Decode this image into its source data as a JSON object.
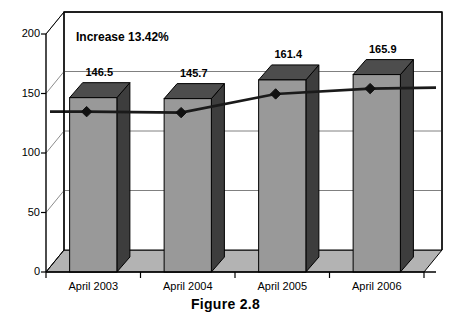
{
  "caption": "Figure 2.8",
  "annotation": "Increase 13.42%",
  "chart_data": {
    "type": "bar",
    "title": "",
    "subtitle": "",
    "xlabel": "",
    "ylabel": "",
    "categories": [
      "April 2003",
      "April 2004",
      "April 2005",
      "April 2006"
    ],
    "values": [
      146.5,
      145.7,
      161.4,
      165.9
    ],
    "data_labels": [
      "146.5",
      "145.7",
      "161.4",
      "165.9"
    ],
    "series": [
      {
        "name": "bars",
        "type": "bar",
        "values": [
          146.5,
          145.7,
          161.4,
          165.9
        ]
      },
      {
        "name": "trend",
        "type": "line",
        "marker": "diamond",
        "values": [
          146.5,
          145.7,
          161.4,
          165.9
        ]
      }
    ],
    "ylim": [
      0,
      200
    ],
    "yticks": [
      0,
      50,
      100,
      150,
      200
    ],
    "ytick_labels": [
      "0",
      "50",
      "100",
      "150",
      "200"
    ],
    "grid": true,
    "grid_axis": "y",
    "legend": false,
    "legend_position": "none",
    "three_d": true,
    "annotations": [
      {
        "text": "Increase 13.42%",
        "position": "top-left-inside-plot"
      }
    ],
    "colors": {
      "bar_front": "#999999",
      "bar_top": "#4d4d4d",
      "bar_side": "#3d3d3d",
      "floor": "#b3b3b3",
      "wall": "#ffffff",
      "grid": "#808080",
      "axis": "#000000",
      "line": "#1a1a1a",
      "marker": "#111111",
      "background": "#ffffff"
    }
  }
}
